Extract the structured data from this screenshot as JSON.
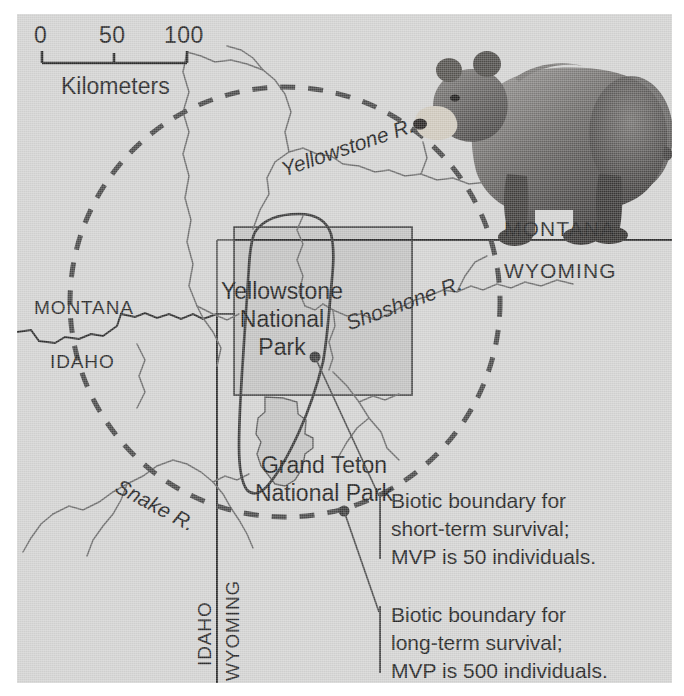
{
  "figure": {
    "kind": "map",
    "title_visible": false,
    "background_color": "#d3d3d2",
    "land_fill": "#d3d3d2",
    "park_fill": "#c2c2c1",
    "ink_color": "#2a2a2a"
  },
  "scale_bar": {
    "ticks": [
      "0",
      "50",
      "100"
    ],
    "unit_label": "Kilometers"
  },
  "state_labels": {
    "montana_right": "MONTANA",
    "wyoming_right": "WYOMING",
    "montana_left": "MONTANA",
    "idaho_left": "IDAHO",
    "idaho_bottom": "IDAHO",
    "wyoming_bottom": "WYOMING"
  },
  "rivers": [
    {
      "name": "Yellowstone R."
    },
    {
      "name": "Shoshone R."
    },
    {
      "name": "Snake R."
    }
  ],
  "parks": [
    {
      "name_line1": "Yellowstone",
      "name_line2": "National",
      "name_line3": "Park"
    },
    {
      "name_line1": "Grand Teton",
      "name_line2": "National Park"
    }
  ],
  "annotations": [
    {
      "id": "short-term",
      "line1": "Biotic boundary for",
      "line2": "short-term survival;",
      "line3": "MVP is 50 individuals.",
      "boundary_style": "solid",
      "mvp": 50,
      "term": "short-term"
    },
    {
      "id": "long-term",
      "line1": "Biotic boundary for",
      "line2": "long-term survival;",
      "line3": "MVP is 500 individuals.",
      "boundary_style": "dashed",
      "mvp": 500,
      "term": "long-term"
    }
  ],
  "illustration": {
    "subject": "grizzly-bear",
    "orientation": "facing-left"
  }
}
